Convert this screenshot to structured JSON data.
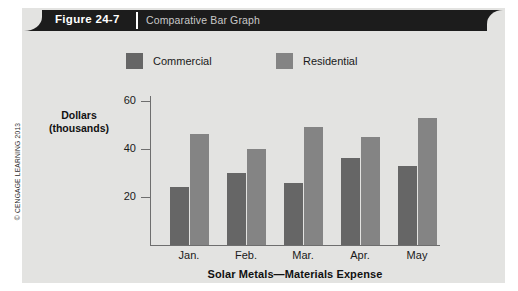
{
  "figure": {
    "number": "Figure 24-7",
    "caption": "Comparative Bar Graph"
  },
  "copyright": "© CENGAGE LEARNING 2013",
  "colors": {
    "card_background": "#e3e3e1",
    "header_bar": "#1c1c1c",
    "commercial": "#666666",
    "residential": "#848484",
    "axis": "#6e6e6e",
    "text": "#1a1a1a"
  },
  "chart_data": {
    "type": "bar",
    "title": "Solar Metals—Materials Expense",
    "xlabel": "",
    "ylabel": "Dollars\n(thousands)",
    "ylabel_line1": "Dollars",
    "ylabel_line2": "(thousands)",
    "categories": [
      "Jan.",
      "Feb.",
      "Mar.",
      "Apr.",
      "May"
    ],
    "series": [
      {
        "name": "Commercial",
        "color": "#666666",
        "values": [
          24,
          30,
          26,
          36,
          33
        ]
      },
      {
        "name": "Residential",
        "color": "#848484",
        "values": [
          46,
          40,
          49,
          45,
          53
        ]
      }
    ],
    "ylim": [
      0,
      62
    ],
    "yticks": [
      20,
      40,
      60
    ],
    "ytick_labels": [
      "20",
      "40",
      "60"
    ],
    "grid": false,
    "legend_position": "top"
  }
}
